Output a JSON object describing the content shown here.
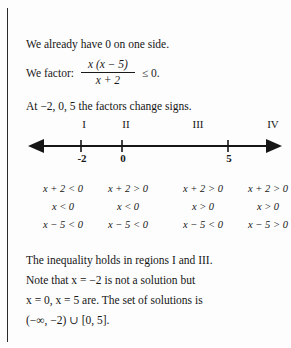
{
  "page": {
    "intro_text": "We already have 0 on one side.",
    "factor_label": "We factor:",
    "fraction": {
      "numerator": "x (x − 5)",
      "denominator": "x + 2"
    },
    "factor_tail": "≤ 0.",
    "signs_change_text": "At −2, 0, 5 the factors change signs."
  },
  "number_line": {
    "regions": [
      {
        "label": "I",
        "x": 58
      },
      {
        "label": "II",
        "x": 100
      },
      {
        "label": "III",
        "x": 172
      },
      {
        "label": "IV",
        "x": 247
      }
    ],
    "ticks": [
      {
        "label": "-2",
        "x": 81
      },
      {
        "label": "0",
        "x": 122
      },
      {
        "label": "5",
        "x": 228
      }
    ],
    "axis": {
      "left_end": 28,
      "right_end": 278,
      "y": 150,
      "left_arrow": true,
      "right_arrow": true
    }
  },
  "sign_table": {
    "columns": [
      {
        "region": "I",
        "x": 52,
        "rows": [
          "x + 2 < 0",
          "x < 0",
          "x − 5 < 0"
        ]
      },
      {
        "region": "II",
        "x": 118,
        "rows": [
          "x + 2 > 0",
          "x < 0",
          "x − 5 < 0"
        ]
      },
      {
        "region": "III",
        "x": 183,
        "rows": [
          "x + 2 > 0",
          "x > 0",
          "x − 5 < 0"
        ]
      },
      {
        "region": "IV",
        "x": 250,
        "rows": [
          "x + 2 > 0",
          "x > 0",
          "x − 5 > 0"
        ]
      }
    ]
  },
  "conclusion": {
    "lines": [
      "The inequality holds in regions I and III.",
      "Note that x = −2 is not a solution but",
      "x = 0, x = 5 are. The set of solutions is",
      "(−∞, −2) ∪ [0, 5]."
    ]
  },
  "colors": {
    "ink": "#161616",
    "rule": "#2a2a2a",
    "paper": "#fdfdfd"
  }
}
